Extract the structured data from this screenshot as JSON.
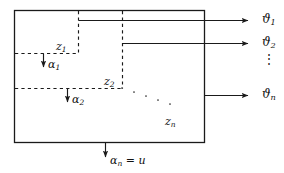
{
  "figure": {
    "background_color": "#ffffff",
    "line_color": "#1a1a1a",
    "box": {
      "x": 14,
      "y": 10,
      "width": 191,
      "height": 133
    },
    "internal_labels": [
      {
        "name": "z1",
        "text": "z",
        "subscript": "1",
        "x": 56,
        "y": 47
      },
      {
        "name": "z2",
        "text": "z",
        "subscript": "2",
        "x": 104,
        "y": 82
      },
      {
        "name": "zn",
        "text": "z",
        "subscript": "n",
        "x": 165,
        "y": 122
      }
    ],
    "alpha_labels": [
      {
        "name": "alpha1",
        "text": "α",
        "subscript": "1",
        "x": 48,
        "y": 64
      },
      {
        "name": "alpha2",
        "text": "α",
        "subscript": "2",
        "x": 71,
        "y": 99
      }
    ],
    "input_label": {
      "name": "alpha-n-equals-u",
      "text": "α",
      "subscript": "n",
      "equals": " = ",
      "value": "u",
      "x": 110,
      "y": 160
    },
    "output_labels": [
      {
        "name": "theta1",
        "text": "ϑ",
        "subscript": "1",
        "x": 262,
        "y": 19
      },
      {
        "name": "theta2",
        "text": "ϑ",
        "subscript": "2",
        "x": 262,
        "y": 42
      },
      {
        "name": "thetan",
        "text": "ϑ",
        "subscript": "n",
        "x": 262,
        "y": 95
      }
    ],
    "vertical_dots": {
      "name": "vertical-ellipsis",
      "text": "⋮",
      "x": 264,
      "y": 63
    },
    "diagonal_dots": {
      "name": "diagonal-ellipsis",
      "count": 5,
      "from_x": 122,
      "from_y": 88,
      "to_x": 170,
      "to_y": 104
    }
  }
}
